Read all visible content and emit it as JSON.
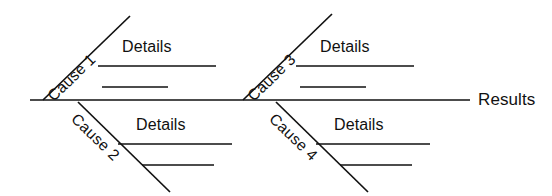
{
  "diagram": {
    "type": "fishbone-ishikawa",
    "background_color": "#ffffff",
    "line_color": "#111111",
    "spine": {
      "label": "Results",
      "label_x": 478,
      "label_y": 100,
      "x1": 30,
      "y1": 100,
      "x2": 470,
      "y2": 100
    },
    "branches": [
      {
        "id": "cause-1",
        "label": "Cause 1",
        "position": "upper-left",
        "direction": "up",
        "bone": {
          "x1": 43,
          "y1": 100,
          "x2": 130,
          "y2": 16
        },
        "label_x": 44,
        "label_y": 92,
        "details_label": "Details",
        "details_x": 122,
        "details_y": 38,
        "detail_lines": [
          {
            "x1": 98,
            "y1": 66,
            "x2": 216,
            "y2": 66
          },
          {
            "x1": 102,
            "y1": 87,
            "x2": 168,
            "y2": 87
          }
        ]
      },
      {
        "id": "cause-3",
        "label": "Cause 3",
        "position": "upper-right",
        "direction": "up",
        "bone": {
          "x1": 243,
          "y1": 100,
          "x2": 332,
          "y2": 14
        },
        "label_x": 244,
        "label_y": 92,
        "details_label": "Details",
        "details_x": 320,
        "details_y": 38,
        "detail_lines": [
          {
            "x1": 296,
            "y1": 66,
            "x2": 414,
            "y2": 66
          },
          {
            "x1": 300,
            "y1": 87,
            "x2": 366,
            "y2": 87
          }
        ]
      },
      {
        "id": "cause-2",
        "label": "Cause 2",
        "position": "lower-left",
        "direction": "down",
        "bone": {
          "x1": 78,
          "y1": 102,
          "x2": 170,
          "y2": 192
        },
        "label_x": 80,
        "label_y": 110,
        "details_label": "Details",
        "details_x": 136,
        "details_y": 116,
        "detail_lines": [
          {
            "x1": 118,
            "y1": 144,
            "x2": 232,
            "y2": 144
          },
          {
            "x1": 142,
            "y1": 165,
            "x2": 214,
            "y2": 165
          }
        ]
      },
      {
        "id": "cause-4",
        "label": "Cause 4",
        "position": "lower-right",
        "direction": "down",
        "bone": {
          "x1": 276,
          "y1": 102,
          "x2": 368,
          "y2": 192
        },
        "label_x": 278,
        "label_y": 110,
        "details_label": "Details",
        "details_x": 334,
        "details_y": 116,
        "detail_lines": [
          {
            "x1": 316,
            "y1": 144,
            "x2": 430,
            "y2": 144
          },
          {
            "x1": 340,
            "y1": 165,
            "x2": 412,
            "y2": 165
          }
        ]
      }
    ]
  }
}
